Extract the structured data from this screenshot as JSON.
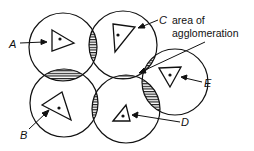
{
  "diagram": {
    "title": "",
    "annotation": {
      "line1": "area of",
      "line2": "agglomeration"
    },
    "labels": {
      "A": "A",
      "B": "B",
      "C": "C",
      "D": "D",
      "E": "E"
    },
    "legend": {
      "triangle_with_dot": "settlement / centre",
      "hatched": "overlap of two market areas",
      "solid": "area of agglomeration"
    },
    "colors": {
      "ink": "#111111",
      "background": "#ffffff"
    }
  }
}
